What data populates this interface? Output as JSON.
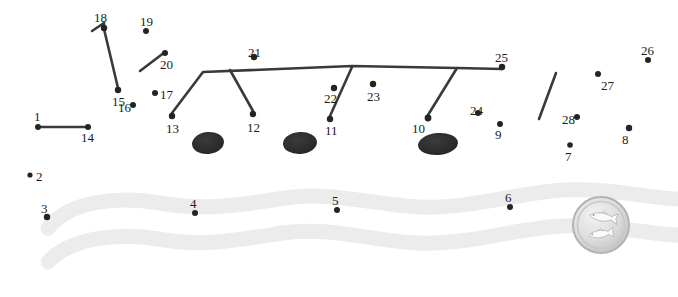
{
  "figure": {
    "kind": "connect-the-dots-puzzle",
    "background": "#ffffff",
    "dot_color": "#242424",
    "line_color": "#3a3a3a",
    "blob_color": "#2f2f2f",
    "band_color": "#ececec",
    "label_color": "#1c1c1c"
  },
  "dots": [
    {
      "n": "1",
      "x": 38,
      "y": 127,
      "r": 3.0,
      "lx": 34,
      "ly": 110
    },
    {
      "n": "2",
      "x": 30,
      "y": 175,
      "r": 2.6,
      "lx": 36,
      "ly": 170
    },
    {
      "n": "3",
      "x": 47,
      "y": 217,
      "r": 3.2,
      "lx": 41,
      "ly": 202
    },
    {
      "n": "4",
      "x": 195,
      "y": 213,
      "r": 3.0,
      "lx": 190,
      "ly": 197
    },
    {
      "n": "5",
      "x": 337,
      "y": 210,
      "r": 3.0,
      "lx": 332,
      "ly": 194
    },
    {
      "n": "6",
      "x": 510,
      "y": 207,
      "r": 3.0,
      "lx": 505,
      "ly": 191
    },
    {
      "n": "7",
      "x": 570,
      "y": 145,
      "r": 2.8,
      "lx": 565,
      "ly": 150
    },
    {
      "n": "8",
      "x": 629,
      "y": 128,
      "r": 3.2,
      "lx": 622,
      "ly": 133
    },
    {
      "n": "9",
      "x": 500,
      "y": 124,
      "r": 3.0,
      "lx": 495,
      "ly": 128
    },
    {
      "n": "10",
      "x": 428,
      "y": 118,
      "r": 3.4,
      "lx": 412,
      "ly": 122
    },
    {
      "n": "11",
      "x": 330,
      "y": 119,
      "r": 3.2,
      "lx": 325,
      "ly": 124
    },
    {
      "n": "12",
      "x": 253,
      "y": 114,
      "r": 3.2,
      "lx": 247,
      "ly": 121
    },
    {
      "n": "13",
      "x": 172,
      "y": 116,
      "r": 3.2,
      "lx": 166,
      "ly": 122
    },
    {
      "n": "14",
      "x": 88,
      "y": 127,
      "r": 3.0,
      "lx": 81,
      "ly": 131
    },
    {
      "n": "15",
      "x": 118,
      "y": 90,
      "r": 3.2,
      "lx": 112,
      "ly": 95
    },
    {
      "n": "16",
      "x": 133,
      "y": 105,
      "r": 3.0,
      "lx": 118,
      "ly": 101
    },
    {
      "n": "17",
      "x": 155,
      "y": 93,
      "r": 3.0,
      "lx": 160,
      "ly": 88
    },
    {
      "n": "18",
      "x": 104,
      "y": 28,
      "r": 3.2,
      "lx": 94,
      "ly": 11
    },
    {
      "n": "19",
      "x": 146,
      "y": 31,
      "r": 3.0,
      "lx": 140,
      "ly": 15
    },
    {
      "n": "20",
      "x": 165,
      "y": 53,
      "r": 3.0,
      "lx": 160,
      "ly": 58
    },
    {
      "n": "21",
      "x": 254,
      "y": 57,
      "r": 3.2,
      "lx": 248,
      "ly": 46
    },
    {
      "n": "22",
      "x": 334,
      "y": 88,
      "r": 3.2,
      "lx": 324,
      "ly": 92
    },
    {
      "n": "23",
      "x": 373,
      "y": 84,
      "r": 3.2,
      "lx": 367,
      "ly": 90
    },
    {
      "n": "24",
      "x": 478,
      "y": 113,
      "r": 3.0,
      "lx": 470,
      "ly": 104
    },
    {
      "n": "25",
      "x": 502,
      "y": 67,
      "r": 3.2,
      "lx": 495,
      "ly": 51
    },
    {
      "n": "26",
      "x": 648,
      "y": 60,
      "r": 3.0,
      "lx": 641,
      "ly": 44
    },
    {
      "n": "27",
      "x": 598,
      "y": 74,
      "r": 3.0,
      "lx": 601,
      "ly": 79
    },
    {
      "n": "28",
      "x": 577,
      "y": 117,
      "r": 3.0,
      "lx": 562,
      "ly": 113
    }
  ],
  "polylines": [
    {
      "name": "segment-1-to-14",
      "points": "38,127 88,127"
    },
    {
      "name": "segment-18-to-15",
      "points": "92,31 104,23 104,29 118,88"
    },
    {
      "name": "segment-near-20",
      "points": "140,71 165,52"
    },
    {
      "name": "ridge-13-21-25",
      "points": "172,113 203,72 352,66 457,68 502,69"
    },
    {
      "name": "branch-to-12",
      "points": "230,70 253,111"
    },
    {
      "name": "branch-to-11",
      "points": "352,67 330,116"
    },
    {
      "name": "branch-to-10",
      "points": "457,68 428,115"
    },
    {
      "name": "segment-free-diagonal",
      "points": "556,73 539,119"
    }
  ],
  "blobs": [
    {
      "name": "dark-blob-left",
      "cx": 208,
      "cy": 143,
      "rx": 16,
      "ry": 11,
      "rot": -6
    },
    {
      "name": "dark-blob-middle",
      "cx": 300,
      "cy": 143,
      "rx": 17,
      "ry": 11,
      "rot": -4
    },
    {
      "name": "dark-blob-right",
      "cx": 438,
      "cy": 144,
      "rx": 20,
      "ry": 11,
      "rot": -5
    }
  ],
  "bands": [
    {
      "name": "wavy-band-upper",
      "path": "M 48,228 C 70,200 120,196 160,203 C 205,211 240,205 285,198 C 330,191 375,205 420,207 C 470,209 520,192 565,190 C 610,188 650,198 676,199"
    },
    {
      "name": "wavy-band-lower",
      "path": "M 48,262 C 70,238 118,232 158,239 C 202,247 238,240 282,233 C 328,226 372,241 418,243 C 468,245 518,228 562,226 C 608,224 650,234 676,235"
    }
  ],
  "medallion": {
    "name": "fish-coin-medallion",
    "cx": 601,
    "cy": 225,
    "r": 28,
    "rim_color": "#cfcfcf",
    "face_color": "#e2e2e2",
    "motif": "two-fish"
  }
}
